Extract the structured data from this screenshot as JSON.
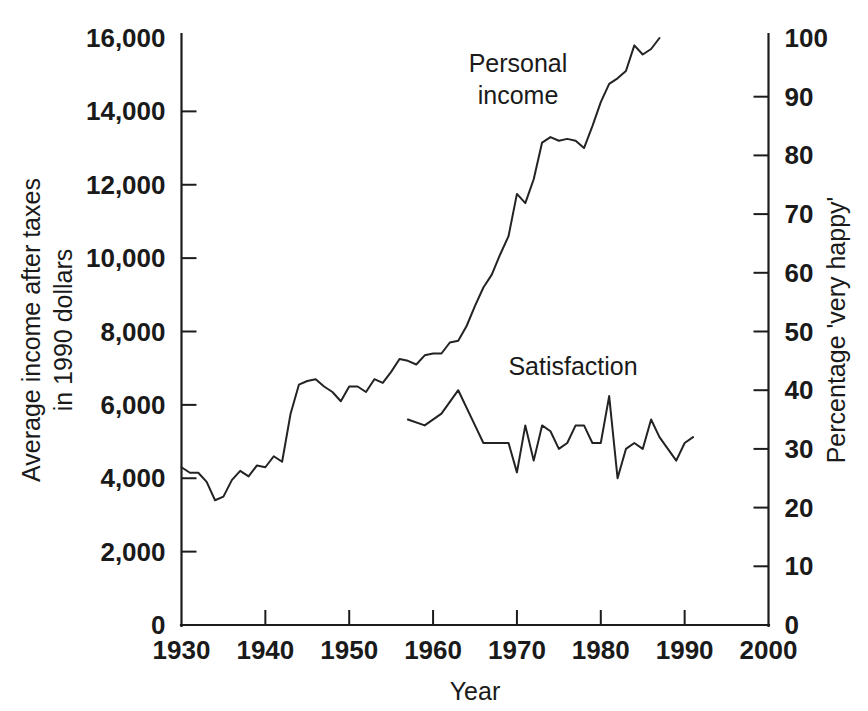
{
  "chart_data": {
    "type": "line",
    "title": "",
    "xlabel": "Year",
    "ylabel": "Average income after taxes in 1990 dollars",
    "ylabel_line1": "Average income after taxes",
    "ylabel_line2": "in 1990 dollars",
    "y2label": "Percentage 'very happy'",
    "xlim": [
      1930,
      2000
    ],
    "ylim": [
      0,
      16000
    ],
    "y2lim": [
      0,
      100
    ],
    "grid": false,
    "legend_position": "inline-annotations",
    "x_ticks": [
      1930,
      1940,
      1950,
      1960,
      1970,
      1980,
      1990,
      2000
    ],
    "x_tick_labels": [
      "1930",
      "1940",
      "1950",
      "1960",
      "1970",
      "1980",
      "1990",
      "2000"
    ],
    "y_ticks": [
      0,
      2000,
      4000,
      6000,
      8000,
      10000,
      12000,
      14000,
      16000
    ],
    "y_tick_labels": [
      "0",
      "2,000",
      "4,000",
      "6,000",
      "8,000",
      "10,000",
      "12,000",
      "14,000",
      "16,000"
    ],
    "y2_ticks": [
      0,
      10,
      20,
      30,
      40,
      50,
      60,
      70,
      80,
      90,
      100
    ],
    "y2_tick_labels": [
      "0",
      "10",
      "20",
      "30",
      "40",
      "50",
      "60",
      "70",
      "80",
      "90",
      "100"
    ],
    "annotations": [
      {
        "text": "Personal income",
        "line1": "Personal",
        "line2": "income",
        "x": 1971,
        "y": 14700
      },
      {
        "text": "Satisfaction",
        "x": 1978,
        "y": 7900
      }
    ],
    "series": [
      {
        "name": "Personal income",
        "axis": "left",
        "units": "1990 dollars",
        "x": [
          1930,
          1931,
          1932,
          1933,
          1934,
          1935,
          1936,
          1937,
          1938,
          1939,
          1940,
          1941,
          1942,
          1943,
          1944,
          1945,
          1946,
          1947,
          1948,
          1949,
          1950,
          1951,
          1952,
          1953,
          1954,
          1955,
          1956,
          1957,
          1958,
          1959,
          1960,
          1961,
          1962,
          1963,
          1964,
          1965,
          1966,
          1967,
          1968,
          1969,
          1970,
          1971,
          1972,
          1973,
          1974,
          1975,
          1976,
          1977,
          1978,
          1979,
          1980,
          1981,
          1982,
          1983,
          1984,
          1985,
          1986,
          1987
        ],
        "values": [
          4300,
          4150,
          4150,
          3900,
          3400,
          3500,
          3950,
          4200,
          4050,
          4350,
          4300,
          4600,
          4450,
          5750,
          6550,
          6650,
          6700,
          6500,
          6350,
          6100,
          6500,
          6500,
          6350,
          6700,
          6600,
          6900,
          7250,
          7200,
          7100,
          7350,
          7400,
          7400,
          7700,
          7750,
          8150,
          8700,
          9200,
          9550,
          10100,
          10600,
          11750,
          11500,
          12150,
          13150,
          13300,
          13200,
          13250,
          13200,
          13000,
          13600,
          14250,
          14750,
          14900,
          15100,
          15800,
          15550,
          15700,
          16000
        ]
      },
      {
        "name": "Satisfaction",
        "axis": "right",
        "units": "percentage 'very happy'",
        "x": [
          1957,
          1959,
          1961,
          1963,
          1965,
          1966,
          1967,
          1969,
          1970,
          1971,
          1972,
          1973,
          1974,
          1975,
          1976,
          1977,
          1978,
          1979,
          1980,
          1981,
          1982,
          1983,
          1984,
          1985,
          1986,
          1987,
          1988,
          1989,
          1990,
          1991
        ],
        "values": [
          35,
          34,
          36,
          40,
          34,
          31,
          31,
          31,
          26,
          34,
          28,
          34,
          33,
          30,
          31,
          34,
          34,
          31,
          31,
          39,
          25,
          30,
          31,
          30,
          35,
          32,
          30,
          28,
          31,
          32
        ]
      }
    ]
  },
  "figure": {
    "caption": ""
  }
}
